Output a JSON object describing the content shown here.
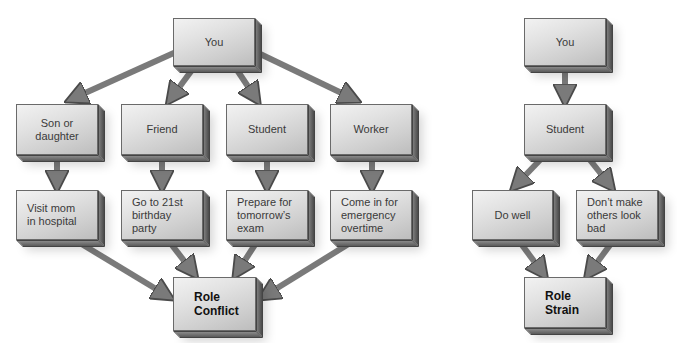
{
  "colors": {
    "arrow_fill": "#7a7a7a",
    "arrow_stroke": "#4a4a4a",
    "box_face_light": "#f2f2f2",
    "box_face_dark": "#bdbdbd",
    "box_side": "#5a5a5a",
    "text": "#3a3a3a",
    "text_bold": "#111111"
  },
  "role_conflict": {
    "you": "You",
    "roles": [
      {
        "label": "Son or\ndaughter",
        "expectation": "Visit mom\nin hospital"
      },
      {
        "label": "Friend",
        "expectation": "Go to 21st\nbirthday\nparty"
      },
      {
        "label": "Student",
        "expectation": "Prepare for\ntomorrow’s\nexam"
      },
      {
        "label": "Worker",
        "expectation": "Come in for\nemergency\novertime"
      }
    ],
    "result": "Role\nConflict"
  },
  "role_strain": {
    "you": "You",
    "role": "Student",
    "expectations": [
      "Do well",
      "Don’t make\nothers look\nbad"
    ],
    "result": "Role\nStrain"
  }
}
